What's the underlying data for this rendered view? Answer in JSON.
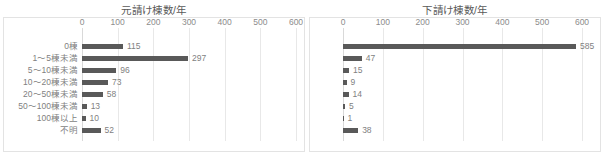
{
  "chart_data": [
    {
      "id": "motouke",
      "type": "bar",
      "orientation": "horizontal",
      "title": "元請け棟数/年",
      "xlabel": "",
      "ylabel": "",
      "xlim": [
        0,
        600
      ],
      "xticks": [
        0,
        100,
        200,
        300,
        400,
        500,
        600
      ],
      "xticklabels": [
        "0",
        "100",
        "200",
        "300",
        "400",
        "500",
        "600"
      ],
      "grid": true,
      "legend": false,
      "bar_color": "#595959",
      "categories": [
        "0棟",
        "1〜5棟未満",
        "5〜10棟未満",
        "10〜20棟未満",
        "20〜50棟未満",
        "50〜100棟未満",
        "100棟以上",
        "不明"
      ],
      "values": [
        115,
        297,
        96,
        73,
        58,
        13,
        10,
        52
      ],
      "datalabels": [
        "115",
        "297",
        "96",
        "73",
        "58",
        "13",
        "10",
        "52"
      ]
    },
    {
      "id": "shitauke",
      "type": "bar",
      "orientation": "horizontal",
      "title": "下請け棟数/年",
      "xlabel": "",
      "ylabel": "",
      "xlim": [
        0,
        600
      ],
      "xticks": [
        0,
        100,
        200,
        300,
        400,
        500,
        600
      ],
      "xticklabels": [
        "0",
        "100",
        "200",
        "300",
        "400",
        "500",
        "600"
      ],
      "grid": true,
      "legend": false,
      "bar_color": "#595959",
      "categories": [
        "",
        "",
        "",
        "",
        "",
        "",
        "",
        ""
      ],
      "values": [
        585,
        47,
        15,
        9,
        14,
        5,
        1,
        38
      ],
      "datalabels": [
        "585",
        "47",
        "15",
        "9",
        "14",
        "5",
        "1",
        "38"
      ]
    }
  ]
}
